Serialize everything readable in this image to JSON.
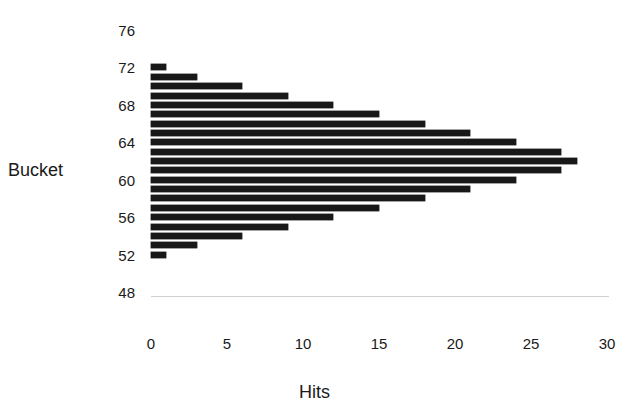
{
  "chart_data": {
    "type": "bar",
    "orientation": "horizontal",
    "title": "",
    "xlabel": "Hits",
    "ylabel": "Bucket",
    "categories": [
      72,
      71,
      70,
      69,
      68,
      67,
      66,
      65,
      64,
      63,
      62,
      61,
      60,
      59,
      58,
      57,
      56,
      55,
      54,
      53,
      52
    ],
    "values": [
      1,
      3,
      6,
      9,
      12,
      15,
      18,
      21,
      24,
      27,
      28,
      27,
      24,
      21,
      18,
      15,
      12,
      9,
      6,
      3,
      1
    ],
    "xlim": [
      0,
      30
    ],
    "ylim": [
      48,
      76
    ],
    "xticks": [
      "0",
      "5",
      "10",
      "15",
      "20",
      "25",
      "30"
    ],
    "xtick_values": [
      0,
      5,
      10,
      15,
      20,
      25,
      30
    ],
    "yticks": [
      "76",
      "72",
      "68",
      "64",
      "60",
      "56",
      "52",
      "48"
    ],
    "ytick_values": [
      76,
      72,
      68,
      64,
      60,
      56,
      52,
      48
    ],
    "grid": false,
    "legend": null,
    "bar_color": "#181818",
    "background": "#ffffff"
  },
  "axes": {
    "y_title": "Bucket",
    "x_title": "Hits"
  }
}
